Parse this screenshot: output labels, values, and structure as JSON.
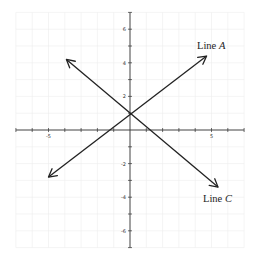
{
  "chart_data": {
    "type": "line",
    "title": "",
    "xlabel": "",
    "ylabel": "",
    "xlim": [
      -7,
      7
    ],
    "ylim": [
      -7,
      7
    ],
    "grid": true,
    "x_tick_labels": [
      {
        "value": -5,
        "label": "-5"
      },
      {
        "value": 5,
        "label": "5"
      }
    ],
    "y_tick_labels": [
      {
        "value": 6,
        "label": "6"
      },
      {
        "value": 4,
        "label": "4"
      },
      {
        "value": 2,
        "label": "2"
      },
      {
        "value": -2,
        "label": "-2"
      },
      {
        "value": -4,
        "label": "-4"
      },
      {
        "value": -6,
        "label": "-6"
      }
    ],
    "series": [
      {
        "name": "Line A",
        "label": "Line",
        "label_italic": "A",
        "x": [
          -5,
          0,
          4.7
        ],
        "y": [
          -2.8,
          1,
          4.4
        ],
        "arrows": "both"
      },
      {
        "name": "Line C",
        "label": "Line",
        "label_italic": "C",
        "x": [
          -3.9,
          0,
          5.4
        ],
        "y": [
          4.2,
          1,
          -3.4
        ],
        "arrows": "both"
      }
    ],
    "intersection": {
      "x": 0,
      "y": 1
    },
    "colors": {
      "line": "#222222",
      "axis": "#333333",
      "grid": "#ececec"
    }
  }
}
